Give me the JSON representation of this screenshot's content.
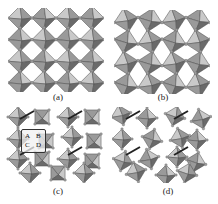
{
  "figure": {
    "panels": [
      {
        "id": "a",
        "caption": "(a)",
        "description": "corner-sharing octahedra, untilted"
      },
      {
        "id": "b",
        "caption": "(b)",
        "description": "corner-sharing octahedra, tilted"
      },
      {
        "id": "c",
        "caption": "(c)",
        "description": "octahedral framework with labeled cell"
      },
      {
        "id": "d",
        "caption": "(d)",
        "description": "distorted octahedral framework"
      }
    ],
    "cell_labels": {
      "A": "A",
      "B": "B",
      "C": "C",
      "D": "D"
    },
    "colors": {
      "light_face": "#c9c9c9",
      "mid_face": "#9a9a9a",
      "dark_face": "#6a6a6a",
      "edge": "#4a4a4a",
      "vertex": "#9e9e9e",
      "background": "#ffffff"
    }
  }
}
